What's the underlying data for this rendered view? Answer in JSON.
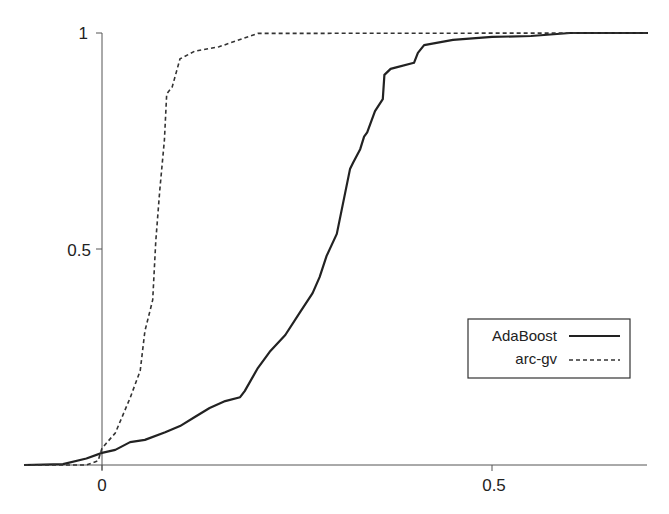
{
  "chart_data": {
    "type": "line",
    "title": "",
    "xlabel": "",
    "ylabel": "",
    "xlim": [
      -0.1,
      0.7
    ],
    "ylim": [
      0,
      1
    ],
    "grid": false,
    "legend_position": "lower right",
    "x_ticks": [
      {
        "value": 0,
        "label": "0"
      },
      {
        "value": 0.5,
        "label": "0.5"
      }
    ],
    "y_ticks": [
      {
        "value": 0.5,
        "label": "0.5"
      },
      {
        "value": 1,
        "label": "1"
      }
    ],
    "series": [
      {
        "name": "AdaBoost",
        "style": "solid",
        "x": [
          -0.1,
          -0.05,
          -0.02,
          0.0,
          0.017,
          0.036,
          0.055,
          0.081,
          0.1,
          0.119,
          0.138,
          0.158,
          0.177,
          0.183,
          0.2,
          0.215,
          0.235,
          0.254,
          0.27,
          0.279,
          0.288,
          0.301,
          0.318,
          0.322,
          0.331,
          0.336,
          0.34,
          0.35,
          0.36,
          0.362,
          0.37,
          0.376,
          0.4,
          0.405,
          0.413,
          0.45,
          0.5,
          0.55,
          0.6,
          0.7
        ],
        "y": [
          0.0,
          0.002,
          0.015,
          0.028,
          0.035,
          0.053,
          0.058,
          0.076,
          0.09,
          0.111,
          0.132,
          0.148,
          0.157,
          0.171,
          0.225,
          0.262,
          0.301,
          0.354,
          0.398,
          0.435,
          0.484,
          0.535,
          0.685,
          0.7,
          0.731,
          0.76,
          0.77,
          0.819,
          0.847,
          0.903,
          0.917,
          0.92,
          0.931,
          0.954,
          0.972,
          0.984,
          0.991,
          0.993,
          1.0,
          1.0
        ]
      },
      {
        "name": "arc-gv",
        "style": "dashed",
        "x": [
          -0.1,
          -0.02,
          -0.005,
          0.0,
          0.017,
          0.036,
          0.049,
          0.055,
          0.065,
          0.069,
          0.074,
          0.08,
          0.083,
          0.09,
          0.1,
          0.119,
          0.15,
          0.2,
          0.7
        ],
        "y": [
          0.0,
          0.0,
          0.01,
          0.039,
          0.074,
          0.155,
          0.218,
          0.31,
          0.382,
          0.519,
          0.634,
          0.752,
          0.859,
          0.875,
          0.94,
          0.958,
          0.968,
          0.999,
          1.0
        ]
      }
    ]
  },
  "legend": {
    "items": [
      {
        "label": "AdaBoost",
        "style": "solid"
      },
      {
        "label": "arc-gv",
        "style": "dashed"
      }
    ]
  },
  "axes": {
    "x_tick_labels": [
      "0",
      "0.5"
    ],
    "y_tick_labels": [
      "0.5",
      "1"
    ]
  }
}
